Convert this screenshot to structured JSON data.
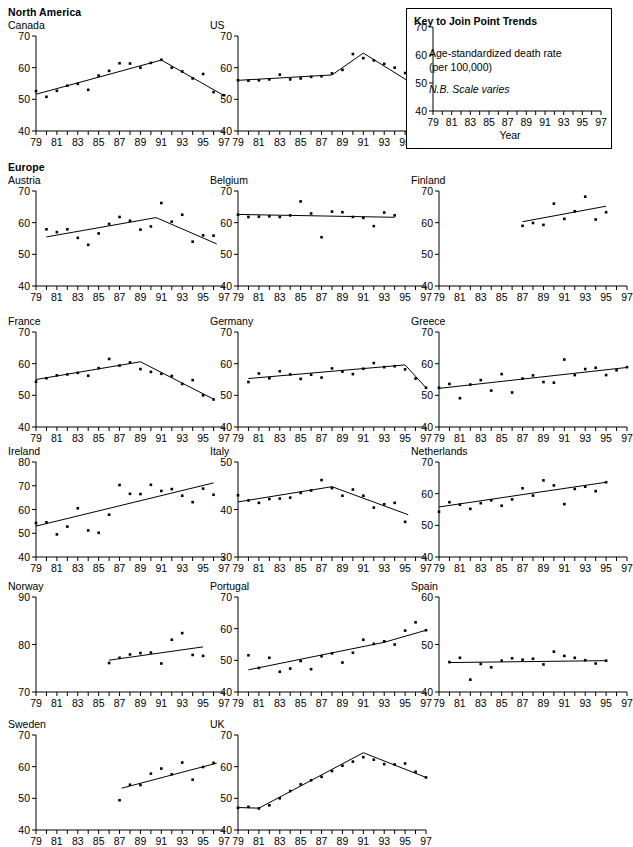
{
  "figure": {
    "axis_label_year": "Year",
    "tick_years": [
      79,
      81,
      83,
      85,
      87,
      89,
      91,
      93,
      95,
      97
    ],
    "x_min": 79,
    "x_max": 97,
    "line_color": "#000000",
    "point_color": "#000000",
    "axis_color": "#000000"
  },
  "key": {
    "title": "Key to Join Point Trends",
    "line1": "Age-standardized death rate",
    "line2": "(per 100,000)",
    "line3": "N.B. Scale varies",
    "xlabel": "Year",
    "ylim": [
      40,
      70
    ],
    "yticks": [
      40,
      50,
      60,
      70
    ]
  },
  "regions": [
    {
      "name": "North America",
      "top": 6
    },
    {
      "name": "Europe",
      "top": 161
    }
  ],
  "chart_data": [
    {
      "type": "scatter",
      "title": "Canada",
      "xlabel": "",
      "ylabel": "",
      "ylim": [
        40,
        70
      ],
      "yticks": [
        40,
        50,
        60,
        70
      ],
      "xlim": [
        79,
        97
      ],
      "grid": false,
      "legend": false,
      "x": [
        79,
        80,
        81,
        82,
        83,
        84,
        85,
        86,
        87,
        88,
        89,
        90,
        91,
        92,
        93,
        94,
        95,
        96,
        97
      ],
      "values": [
        52.6,
        50.8,
        52.7,
        54.3,
        54.9,
        53.0,
        57.5,
        59.0,
        61.4,
        61.3,
        60.0,
        61.5,
        62.5,
        60.0,
        58.8,
        56.6,
        58.0,
        52.3,
        51.3
      ],
      "joinpoints": [
        {
          "x": 79,
          "y": 51.6
        },
        {
          "x": 91,
          "y": 62.4
        },
        {
          "x": 97,
          "y": 51.2
        }
      ]
    },
    {
      "type": "scatter",
      "title": "US",
      "xlabel": "",
      "ylabel": "",
      "ylim": [
        40,
        70
      ],
      "yticks": [
        40,
        50,
        60,
        70
      ],
      "xlim": [
        79,
        97
      ],
      "grid": false,
      "legend": false,
      "x": [
        79,
        80,
        81,
        82,
        83,
        84,
        85,
        86,
        87,
        88,
        89,
        90,
        91,
        92,
        93,
        94,
        95,
        96,
        97
      ],
      "values": [
        56.0,
        55.9,
        56.0,
        56.3,
        57.8,
        56.3,
        56.6,
        57.1,
        57.3,
        58.2,
        59.3,
        64.3,
        63.0,
        62.3,
        61.2,
        60.0,
        58.3,
        55.5,
        50.7
      ],
      "joinpoints": [
        {
          "x": 79,
          "y": 56.0
        },
        {
          "x": 88,
          "y": 57.7
        },
        {
          "x": 91,
          "y": 64.6
        },
        {
          "x": 97,
          "y": 52.3
        }
      ]
    },
    {
      "type": "scatter",
      "title": "Austria",
      "xlabel": "",
      "ylabel": "",
      "ylim": [
        40,
        70
      ],
      "yticks": [
        40,
        50,
        60,
        70
      ],
      "xlim": [
        79,
        97
      ],
      "grid": false,
      "legend": false,
      "x": [
        80,
        81,
        82,
        83,
        84,
        85,
        86,
        87,
        88,
        89,
        90,
        91,
        92,
        93,
        94,
        95,
        96
      ],
      "values": [
        57.9,
        57.0,
        57.9,
        55.2,
        53.0,
        56.6,
        59.6,
        61.8,
        60.6,
        57.8,
        58.8,
        66.2,
        60.3,
        62.5,
        54.0,
        56.0,
        55.9,
        53.2
      ],
      "joinpoints": [
        {
          "x": 80,
          "y": 55.5
        },
        {
          "x": 90.5,
          "y": 61.6
        },
        {
          "x": 96.3,
          "y": 53.3
        }
      ]
    },
    {
      "type": "scatter",
      "title": "Belgium",
      "xlabel": "",
      "ylabel": "",
      "ylim": [
        40,
        70
      ],
      "yticks": [
        40,
        50,
        60,
        70
      ],
      "xlim": [
        79,
        97
      ],
      "grid": false,
      "legend": false,
      "x": [
        79,
        80,
        81,
        82,
        83,
        84,
        85,
        86,
        87,
        88,
        89,
        90,
        91,
        92,
        93,
        94
      ],
      "values": [
        62.5,
        61.8,
        61.9,
        62.0,
        61.8,
        62.3,
        66.7,
        62.9,
        55.4,
        63.5,
        63.3,
        61.8,
        61.5,
        58.9,
        63.2,
        62.3
      ],
      "joinpoints": [
        {
          "x": 79,
          "y": 62.6
        },
        {
          "x": 94,
          "y": 61.7
        }
      ]
    },
    {
      "type": "scatter",
      "title": "Finland",
      "xlabel": "",
      "ylabel": "",
      "ylim": [
        40,
        70
      ],
      "yticks": [
        40,
        50,
        60,
        70
      ],
      "xlim": [
        79,
        97
      ],
      "grid": false,
      "legend": false,
      "x": [
        87,
        88,
        89,
        90,
        91,
        92,
        93,
        94,
        95
      ],
      "values": [
        59.0,
        59.9,
        59.3,
        66.0,
        61.2,
        63.6,
        68.2,
        61.0,
        63.3
      ],
      "joinpoints": [
        {
          "x": 87,
          "y": 60.3
        },
        {
          "x": 95,
          "y": 65.2
        }
      ]
    },
    {
      "type": "scatter",
      "title": "France",
      "xlabel": "",
      "ylabel": "",
      "ylim": [
        40,
        70
      ],
      "yticks": [
        40,
        50,
        60,
        70
      ],
      "xlim": [
        79,
        97
      ],
      "grid": false,
      "legend": false,
      "x": [
        79,
        80,
        81,
        82,
        83,
        84,
        85,
        86,
        87,
        88,
        89,
        90,
        91,
        92,
        93,
        94,
        95,
        96
      ],
      "values": [
        54.3,
        55.4,
        56.3,
        56.6,
        57.1,
        56.2,
        58.6,
        61.5,
        59.4,
        60.4,
        58.3,
        57.4,
        56.8,
        56.1,
        53.6,
        54.8,
        50.0,
        48.7
      ],
      "joinpoints": [
        {
          "x": 79,
          "y": 55.0
        },
        {
          "x": 89,
          "y": 60.6
        },
        {
          "x": 96,
          "y": 48.8
        }
      ]
    },
    {
      "type": "scatter",
      "title": "Germany",
      "xlabel": "",
      "ylabel": "",
      "ylim": [
        40,
        70
      ],
      "yticks": [
        40,
        50,
        60,
        70
      ],
      "xlim": [
        79,
        97
      ],
      "grid": false,
      "legend": false,
      "x": [
        80,
        81,
        82,
        83,
        84,
        85,
        86,
        87,
        88,
        89,
        90,
        91,
        92,
        93,
        94,
        95,
        96,
        97
      ],
      "values": [
        54.2,
        56.9,
        55.4,
        57.6,
        56.6,
        55.2,
        56.5,
        55.6,
        58.5,
        57.5,
        56.7,
        58.4,
        60.2,
        58.9,
        59.2,
        58.2,
        55.3,
        52.4
      ],
      "joinpoints": [
        {
          "x": 80,
          "y": 55.3
        },
        {
          "x": 95,
          "y": 59.6
        },
        {
          "x": 97,
          "y": 52.4
        }
      ]
    },
    {
      "type": "scatter",
      "title": "Greece",
      "xlabel": "",
      "ylabel": "",
      "ylim": [
        40,
        70
      ],
      "yticks": [
        40,
        50,
        60,
        70
      ],
      "xlim": [
        79,
        97
      ],
      "grid": false,
      "legend": false,
      "x": [
        79,
        80,
        81,
        82,
        83,
        84,
        85,
        86,
        87,
        88,
        89,
        90,
        91,
        92,
        93,
        94,
        95,
        96,
        97
      ],
      "values": [
        52.4,
        53.6,
        49.1,
        53.4,
        54.8,
        51.5,
        56.7,
        50.9,
        55.3,
        56.3,
        54.2,
        54.0,
        61.3,
        56.4,
        58.3,
        58.7,
        56.4,
        57.9,
        58.9
      ],
      "joinpoints": [
        {
          "x": 79,
          "y": 52.2
        },
        {
          "x": 97,
          "y": 58.8
        }
      ]
    },
    {
      "type": "scatter",
      "title": "Ireland",
      "xlabel": "",
      "ylabel": "",
      "ylim": [
        40,
        80
      ],
      "yticks": [
        40,
        50,
        60,
        70,
        80
      ],
      "xlim": [
        79,
        97
      ],
      "grid": false,
      "legend": false,
      "x": [
        79,
        80,
        81,
        82,
        83,
        84,
        85,
        86,
        87,
        88,
        89,
        90,
        91,
        92,
        93,
        94,
        95,
        96
      ],
      "values": [
        54.3,
        54.6,
        49.5,
        52.8,
        60.5,
        51.2,
        50.2,
        57.8,
        70.3,
        66.6,
        66.5,
        70.4,
        67.8,
        68.6,
        65.8,
        63.1,
        68.8,
        66.2
      ],
      "joinpoints": [
        {
          "x": 79,
          "y": 53.0
        },
        {
          "x": 96,
          "y": 71.2
        }
      ]
    },
    {
      "type": "scatter",
      "title": "Italy",
      "xlabel": "",
      "ylabel": "",
      "ylim": [
        30,
        50
      ],
      "yticks": [
        30,
        40,
        50
      ],
      "xlim": [
        79,
        97
      ],
      "grid": false,
      "legend": false,
      "x": [
        79,
        80,
        81,
        82,
        83,
        84,
        85,
        86,
        87,
        88,
        89,
        90,
        91,
        92,
        93,
        94,
        95
      ],
      "values": [
        43.0,
        41.9,
        41.4,
        42.2,
        42.3,
        42.5,
        43.5,
        44.0,
        46.2,
        44.5,
        42.9,
        44.2,
        42.9,
        40.4,
        41.1,
        41.4,
        37.4
      ],
      "joinpoints": [
        {
          "x": 79,
          "y": 41.6
        },
        {
          "x": 88,
          "y": 44.8
        },
        {
          "x": 95.3,
          "y": 38.9
        }
      ]
    },
    {
      "type": "scatter",
      "title": "Netherlands",
      "xlabel": "",
      "ylabel": "",
      "ylim": [
        40,
        70
      ],
      "yticks": [
        40,
        50,
        60,
        70
      ],
      "xlim": [
        79,
        97
      ],
      "grid": false,
      "legend": false,
      "x": [
        79,
        80,
        81,
        82,
        83,
        84,
        85,
        86,
        87,
        88,
        89,
        90,
        91,
        92,
        93,
        94,
        95
      ],
      "values": [
        54.3,
        57.3,
        56.5,
        55.2,
        57.0,
        57.9,
        56.2,
        58.2,
        61.7,
        59.4,
        64.2,
        62.6,
        56.7,
        61.5,
        62.2,
        60.8,
        63.6
      ],
      "joinpoints": [
        {
          "x": 79,
          "y": 55.8
        },
        {
          "x": 95,
          "y": 63.6
        }
      ]
    },
    {
      "type": "scatter",
      "title": "Norway",
      "xlabel": "",
      "ylabel": "",
      "ylim": [
        70,
        90
      ],
      "yticks": [
        70,
        80,
        90
      ],
      "xlim": [
        79,
        97
      ],
      "grid": false,
      "legend": false,
      "x": [
        86,
        87,
        88,
        89,
        90,
        91,
        92,
        93,
        94,
        95
      ],
      "values": [
        76.1,
        77.2,
        77.9,
        78.2,
        78.3,
        76.0,
        81.0,
        82.4,
        77.8,
        77.6
      ],
      "joinpoints": [
        {
          "x": 86,
          "y": 76.7
        },
        {
          "x": 95,
          "y": 79.5
        }
      ]
    },
    {
      "type": "scatter",
      "title": "Portugal",
      "xlabel": "",
      "ylabel": "",
      "ylim": [
        40,
        70
      ],
      "yticks": [
        40,
        50,
        60,
        70
      ],
      "xlim": [
        79,
        97
      ],
      "grid": false,
      "legend": false,
      "x": [
        80,
        81,
        82,
        83,
        84,
        85,
        86,
        87,
        88,
        89,
        90,
        91,
        92,
        93,
        94,
        95,
        96,
        97
      ],
      "values": [
        51.6,
        47.6,
        50.8,
        46.4,
        47.4,
        49.8,
        47.2,
        51.3,
        52.2,
        49.3,
        52.4,
        56.5,
        55.2,
        56.0,
        55.0,
        59.4,
        62.0,
        59.5
      ],
      "joinpoints": [
        {
          "x": 80,
          "y": 47.0
        },
        {
          "x": 93,
          "y": 55.7
        },
        {
          "x": 97,
          "y": 59.5
        }
      ]
    },
    {
      "type": "scatter",
      "title": "Spain",
      "xlabel": "",
      "ylabel": "",
      "ylim": [
        40,
        60
      ],
      "yticks": [
        40,
        50,
        60
      ],
      "xlim": [
        79,
        97
      ],
      "grid": false,
      "legend": false,
      "x": [
        80,
        81,
        82,
        83,
        84,
        85,
        86,
        87,
        88,
        89,
        90,
        91,
        92,
        93,
        94,
        95
      ],
      "values": [
        46.3,
        47.2,
        42.6,
        45.9,
        45.2,
        46.6,
        47.1,
        46.8,
        47.0,
        45.8,
        48.5,
        47.6,
        47.2,
        46.7,
        46.0,
        46.6
      ],
      "joinpoints": [
        {
          "x": 80,
          "y": 46.2
        },
        {
          "x": 95,
          "y": 46.6
        }
      ]
    },
    {
      "type": "scatter",
      "title": "Sweden",
      "xlabel": "",
      "ylabel": "",
      "ylim": [
        40,
        70
      ],
      "yticks": [
        40,
        50,
        60,
        70
      ],
      "xlim": [
        79,
        97
      ],
      "grid": false,
      "legend": false,
      "x": [
        87,
        88,
        89,
        90,
        91,
        92,
        93,
        94,
        95,
        96
      ],
      "values": [
        49.4,
        54.3,
        54.2,
        57.8,
        59.4,
        57.6,
        61.3,
        55.9,
        59.9,
        61.2
      ],
      "joinpoints": [
        {
          "x": 87.2,
          "y": 53.2
        },
        {
          "x": 96.3,
          "y": 61.1
        }
      ]
    },
    {
      "type": "scatter",
      "title": "UK",
      "xlabel": "",
      "ylabel": "",
      "ylim": [
        40,
        70
      ],
      "yticks": [
        40,
        50,
        60,
        70
      ],
      "xlim": [
        79,
        97
      ],
      "grid": false,
      "legend": false,
      "x": [
        79,
        80,
        81,
        82,
        83,
        84,
        85,
        86,
        87,
        88,
        89,
        90,
        91,
        92,
        93,
        94,
        95,
        96,
        97
      ],
      "values": [
        47.0,
        47.3,
        46.8,
        47.8,
        50.0,
        52.3,
        54.4,
        55.7,
        56.8,
        58.6,
        60.3,
        61.6,
        63.0,
        62.2,
        60.8,
        60.7,
        61.0,
        58.4,
        56.6
      ],
      "joinpoints": [
        {
          "x": 79,
          "y": 47.1
        },
        {
          "x": 81,
          "y": 46.9
        },
        {
          "x": 91,
          "y": 64.4
        },
        {
          "x": 97,
          "y": 56.6
        }
      ]
    }
  ],
  "layout": {
    "columns": [
      8,
      210,
      411
    ],
    "rows": [
      19,
      174,
      315,
      445,
      580,
      718
    ],
    "panel_positions": [
      {
        "chart": 0,
        "col": 0,
        "row": 0
      },
      {
        "chart": 1,
        "col": 1,
        "row": 0
      },
      {
        "chart": 2,
        "col": 0,
        "row": 1
      },
      {
        "chart": 3,
        "col": 1,
        "row": 1
      },
      {
        "chart": 4,
        "col": 2,
        "row": 1
      },
      {
        "chart": 5,
        "col": 0,
        "row": 2
      },
      {
        "chart": 6,
        "col": 1,
        "row": 2
      },
      {
        "chart": 7,
        "col": 2,
        "row": 2
      },
      {
        "chart": 8,
        "col": 0,
        "row": 3
      },
      {
        "chart": 9,
        "col": 1,
        "row": 3
      },
      {
        "chart": 10,
        "col": 2,
        "row": 3
      },
      {
        "chart": 11,
        "col": 0,
        "row": 4
      },
      {
        "chart": 12,
        "col": 1,
        "row": 4
      },
      {
        "chart": 13,
        "col": 2,
        "row": 4
      },
      {
        "chart": 14,
        "col": 0,
        "row": 5
      },
      {
        "chart": 15,
        "col": 1,
        "row": 5
      }
    ]
  }
}
